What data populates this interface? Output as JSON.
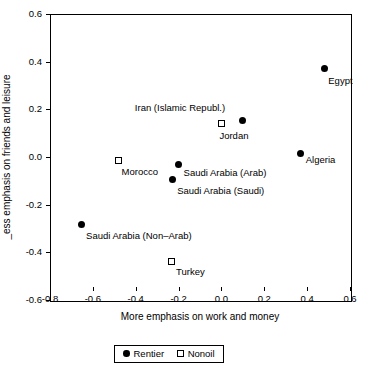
{
  "chart_data": {
    "type": "scatter",
    "title": "",
    "xlabel": "More emphasis on work and money",
    "ylabel": "Less emphasis on friends and leisure",
    "ylabel_rendered": "_ess emphasis on friends and leisure",
    "xlim": [
      -0.8,
      0.6
    ],
    "ylim": [
      -0.6,
      0.6
    ],
    "xticks": [
      "-0.8",
      "-0.6",
      "-0.4",
      "-0.2",
      "0.0",
      "0.2",
      "0.4",
      "0.6"
    ],
    "xtick_values": [
      -0.8,
      -0.6,
      -0.4,
      -0.2,
      0.0,
      0.2,
      0.4,
      0.6
    ],
    "yticks": [
      "0.6",
      "0.4",
      "0.2",
      "0.0",
      "-0.2",
      "-0.4",
      "-0.6"
    ],
    "ytick_values": [
      0.6,
      0.4,
      0.2,
      0.0,
      -0.2,
      -0.4,
      -0.6
    ],
    "grid": false,
    "legend_position": "bottom-center",
    "series": [
      {
        "name": "Rentier",
        "marker": "filled-circle",
        "color": "#000000",
        "points": [
          {
            "label": "Egypt",
            "x": 0.48,
            "y": 0.37,
            "label_dx": 4,
            "label_dy": 6
          },
          {
            "label": "Iran (Islamic Republ.)",
            "x": 0.1,
            "y": 0.155,
            "label_dx": -108,
            "label_dy": -18
          },
          {
            "label": "Algeria",
            "x": 0.37,
            "y": 0.015,
            "label_dx": 5,
            "label_dy": 1
          },
          {
            "label": "Saudi Arabia (Arab)",
            "x": -0.2,
            "y": -0.03,
            "label_dx": 5,
            "label_dy": 3
          },
          {
            "label": "Saudi Arabia (Saudi)",
            "x": -0.23,
            "y": -0.095,
            "label_dx": 5,
            "label_dy": 5
          },
          {
            "label": "Saudi Arabia (Non–Arab)",
            "x": -0.655,
            "y": -0.285,
            "label_dx": 5,
            "label_dy": 5
          }
        ]
      },
      {
        "name": "Nonoil",
        "marker": "open-square",
        "color": "#000000",
        "points": [
          {
            "label": "Jordan",
            "x": 0.0,
            "y": 0.14,
            "label_dx": -2,
            "label_dy": 6
          },
          {
            "label": "Morocco",
            "x": -0.48,
            "y": -0.015,
            "label_dx": 3,
            "label_dy": 5
          },
          {
            "label": "Turkey",
            "x": -0.235,
            "y": -0.44,
            "label_dx": 5,
            "label_dy": 4
          }
        ]
      }
    ]
  },
  "legend": {
    "entries": [
      {
        "label": "Rentier",
        "marker": "filled-circle"
      },
      {
        "label": "Nonoil",
        "marker": "open-square"
      }
    ]
  }
}
